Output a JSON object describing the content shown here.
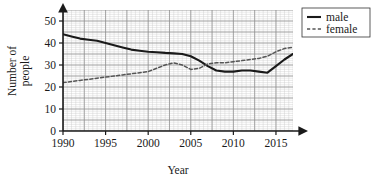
{
  "chart_data": {
    "type": "line",
    "title": "",
    "xlabel": "Year",
    "ylabel": "Number of people",
    "ylabel_line1": "Number of",
    "ylabel_line2": "people",
    "xlim": [
      1990,
      2017
    ],
    "ylim": [
      0,
      55
    ],
    "xticks": [
      1990,
      1995,
      2000,
      2005,
      2010,
      2015
    ],
    "yticks": [
      0,
      10,
      20,
      30,
      40,
      50
    ],
    "xtick_labels": [
      "1990",
      "1995",
      "2000",
      "2005",
      "2010",
      "2015"
    ],
    "ytick_labels": [
      "0",
      "10",
      "20",
      "30",
      "40",
      "50"
    ],
    "grid": true,
    "grid_minor_step_x": 0.5,
    "grid_minor_step_y": 1,
    "grid_major_step_x": 2.5,
    "grid_major_step_y": 5,
    "legend_position": "top-right",
    "x": [
      1990,
      1991,
      1992,
      1993,
      1994,
      1995,
      1996,
      1997,
      1998,
      1999,
      2000,
      2001,
      2002,
      2003,
      2004,
      2005,
      2006,
      2007,
      2008,
      2009,
      2010,
      2011,
      2012,
      2013,
      2014,
      2015,
      2016,
      2017
    ],
    "series": [
      {
        "name": "male",
        "style": "solid",
        "color": "#1a1a1a",
        "values": [
          44,
          43,
          42,
          41.5,
          41,
          40,
          39,
          38,
          37,
          36.5,
          36,
          35.8,
          35.5,
          35.3,
          35,
          34,
          32,
          29.5,
          27.5,
          27,
          27,
          27.5,
          27.5,
          27,
          26.5,
          29.5,
          32.5,
          35
        ]
      },
      {
        "name": "female",
        "style": "dashed",
        "color": "#555555",
        "values": [
          22,
          22.5,
          23,
          23.5,
          24,
          24.5,
          25,
          25.5,
          26,
          26.5,
          27,
          28.5,
          30,
          31,
          30,
          28,
          28.5,
          30.5,
          31,
          31,
          31.5,
          32,
          32.5,
          33,
          34,
          36,
          37.5,
          38
        ]
      }
    ]
  },
  "legend": {
    "items": [
      {
        "label": "male",
        "style": "solid"
      },
      {
        "label": "female",
        "style": "dashed"
      }
    ]
  }
}
